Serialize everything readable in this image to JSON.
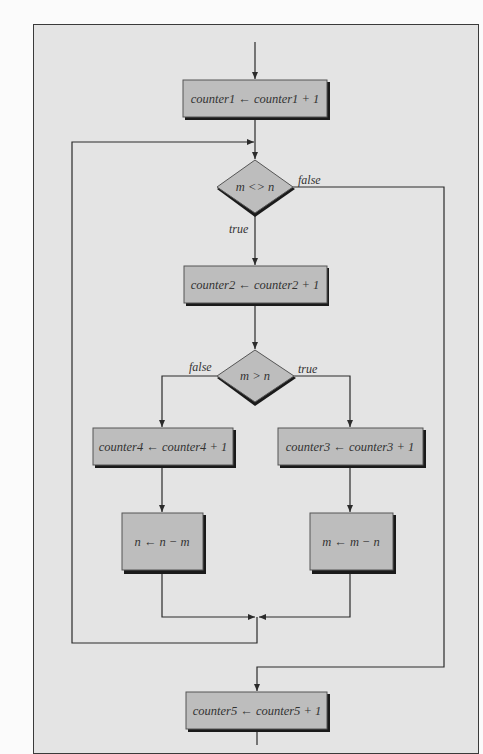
{
  "figure": {
    "type": "flowchart",
    "colors": {
      "page_background": "#fbfbfb",
      "panel_background": "#e4e4e4",
      "node_fill": "#bdbdbd",
      "node_shadow": "#1a1a1a",
      "line": "#2b2b2b",
      "text": "#333333"
    }
  },
  "nodes": {
    "counter1": {
      "kind": "process",
      "lhs": "counter1",
      "arrow": "←",
      "rhs": "counter1 + 1"
    },
    "decision1": {
      "kind": "decision",
      "text": "m <> n"
    },
    "counter2": {
      "kind": "process",
      "lhs": "counter2",
      "arrow": "←",
      "rhs": "counter2 + 1"
    },
    "decision2": {
      "kind": "decision",
      "text": "m > n"
    },
    "counter4": {
      "kind": "process",
      "lhs": "counter4",
      "arrow": "←",
      "rhs": "counter4 + 1"
    },
    "counter3": {
      "kind": "process",
      "lhs": "counter3",
      "arrow": "←",
      "rhs": "counter3 + 1"
    },
    "assign_n": {
      "kind": "process",
      "lhs": "n",
      "arrow": "←",
      "rhs": "n − m"
    },
    "assign_m": {
      "kind": "process",
      "lhs": "m",
      "arrow": "←",
      "rhs": "m − n"
    },
    "counter5": {
      "kind": "process",
      "lhs": "counter5",
      "arrow": "←",
      "rhs": "counter5 + 1"
    }
  },
  "edge_labels": {
    "decision1_false": "false",
    "decision1_true": "true",
    "decision2_false": "false",
    "decision2_true": "true"
  },
  "text": {
    "counter1": "counter1 ← counter1 + 1",
    "decision1": "m <> n",
    "counter2": "counter2 ← counter2 + 1",
    "decision2": "m > n",
    "counter4": "counter4 ← counter4 + 1",
    "counter3": "counter3 ← counter3 + 1",
    "assign_n": "n ← n − m",
    "assign_m": "m ← m − n",
    "counter5": "counter5 ← counter5 + 1"
  },
  "edges": [
    {
      "from": "entry",
      "to": "counter1"
    },
    {
      "from": "counter1",
      "to": "decision1"
    },
    {
      "from": "decision1",
      "to": "counter2",
      "label": "true"
    },
    {
      "from": "decision1",
      "to": "counter5",
      "label": "false"
    },
    {
      "from": "counter2",
      "to": "decision2"
    },
    {
      "from": "decision2",
      "to": "counter4",
      "label": "false"
    },
    {
      "from": "decision2",
      "to": "counter3",
      "label": "true"
    },
    {
      "from": "counter4",
      "to": "assign_n"
    },
    {
      "from": "counter3",
      "to": "assign_m"
    },
    {
      "from": "assign_n",
      "to": "merge"
    },
    {
      "from": "assign_m",
      "to": "merge"
    },
    {
      "from": "merge",
      "to": "decision1"
    },
    {
      "from": "counter5",
      "to": "exit"
    }
  ]
}
